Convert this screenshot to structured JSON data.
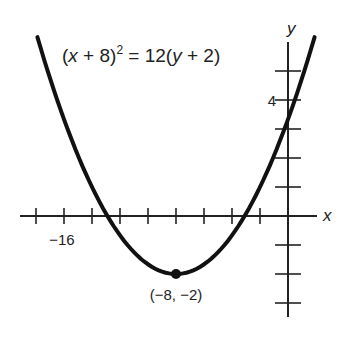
{
  "chart_data": {
    "type": "line",
    "title": "",
    "equation": "(x + 8)^2 = 12(y + 2)",
    "equation_parts": {
      "lhs_open": "(",
      "lhs_var": "x",
      "lhs_rest": " + 8)",
      "exp": "2",
      "mid": " = 12(",
      "rhs_var": "y",
      "rhs_rest": " + 2)"
    },
    "xlabel": "x",
    "ylabel": "y",
    "xlim": [
      -19,
      2
    ],
    "ylim": [
      -3.5,
      6.2
    ],
    "x_tick_step": 2,
    "y_tick_step": 1,
    "x_ticks": [
      -18,
      -16,
      -14,
      -12,
      -10,
      -8,
      -6,
      -4,
      -2
    ],
    "y_ticks": [
      -3,
      -2,
      -1,
      1,
      2,
      3,
      4,
      5
    ],
    "x_tick_labels": [
      {
        "value": -16,
        "text": "−16"
      }
    ],
    "y_tick_labels": [
      {
        "value": 4,
        "text": "4"
      }
    ],
    "series": [
      {
        "name": "(x + 8)^2 = 12(y + 2)",
        "curve": "parabola",
        "vertex": [
          -8,
          -2
        ],
        "p": 3,
        "x_range": [
          -17.9,
          1.9
        ],
        "points": [
          [
            -17.9,
            6.17
          ],
          [
            -16,
            3.33
          ],
          [
            -14,
            1.0
          ],
          [
            -12,
            -0.67
          ],
          [
            -10,
            -1.67
          ],
          [
            -8,
            -2
          ],
          [
            -6,
            -1.67
          ],
          [
            -4,
            -0.67
          ],
          [
            -2,
            1.0
          ],
          [
            0,
            3.33
          ],
          [
            1.9,
            6.17
          ]
        ]
      }
    ],
    "annotations": [
      {
        "point": [
          -8,
          -2
        ],
        "text": "(−8, −2)",
        "marker": "dot"
      }
    ],
    "grid": false,
    "legend": null
  }
}
